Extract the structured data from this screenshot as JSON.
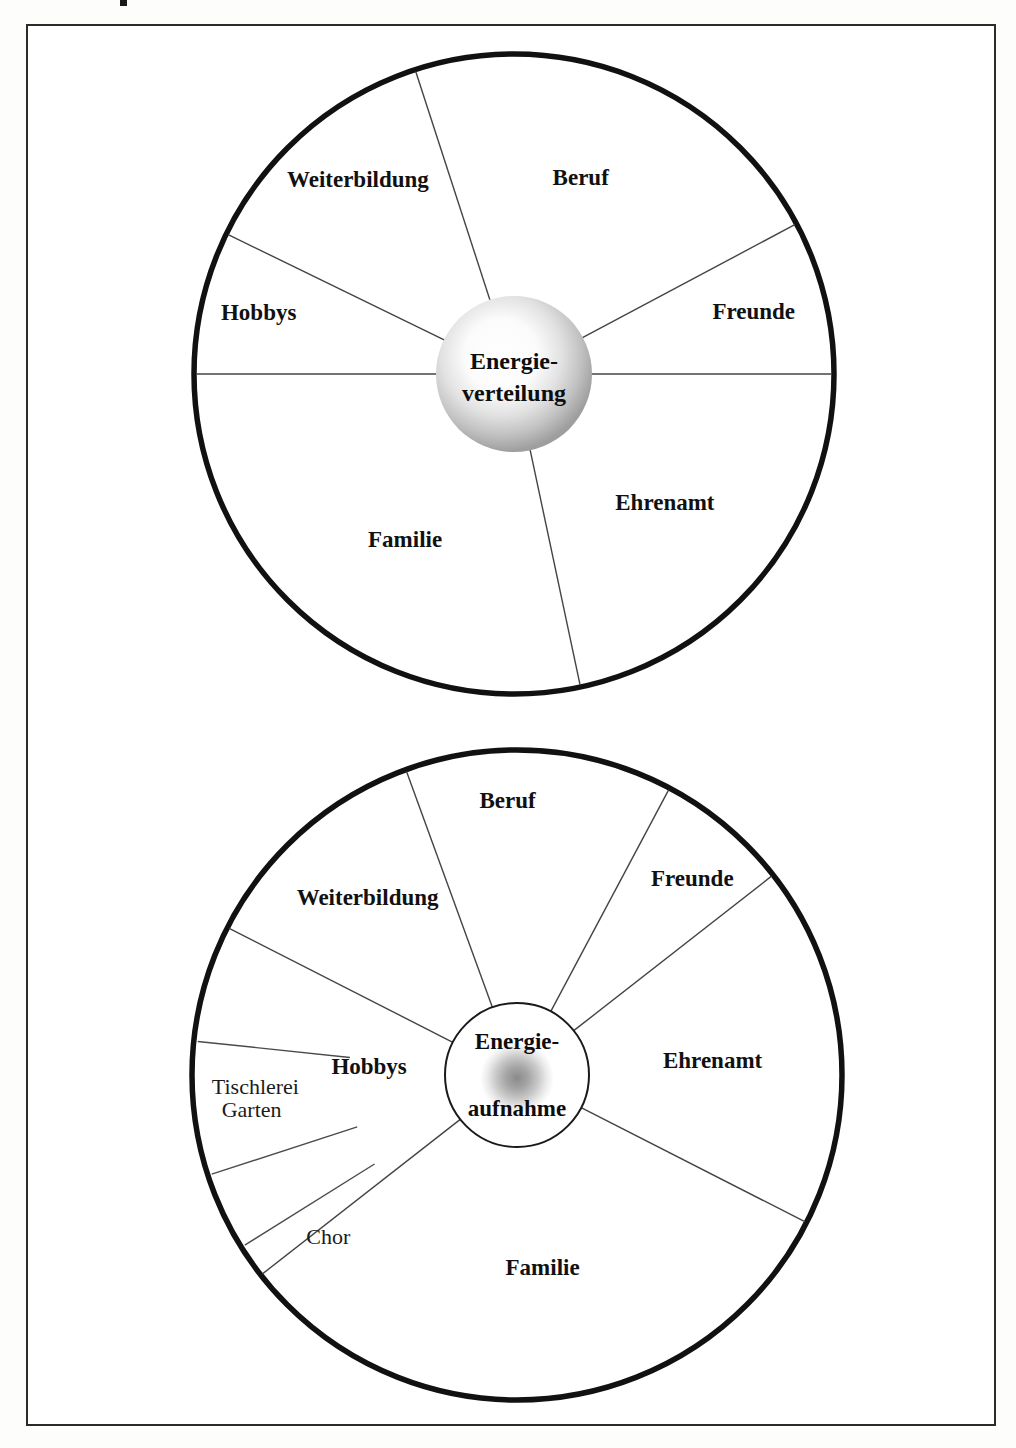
{
  "page": {
    "background_color": "#ffffff",
    "frame_color": "#2b2b2b"
  },
  "diagrams": [
    {
      "id": "energieverteilung",
      "hub_line1": "Energie-",
      "hub_line2": "verteilung",
      "hub_style": "light-sphere",
      "sectors": [
        {
          "label": "Beruf",
          "start_deg": 342,
          "end_deg": 62
        },
        {
          "label": "Freunde",
          "start_deg": 62,
          "end_deg": 90
        },
        {
          "label": "Ehrenamt",
          "start_deg": 90,
          "end_deg": 168
        },
        {
          "label": "Familie",
          "start_deg": 168,
          "end_deg": 270
        },
        {
          "label": "Hobbys",
          "start_deg": 270,
          "end_deg": 296
        },
        {
          "label": "Weiterbildung",
          "start_deg": 296,
          "end_deg": 342
        }
      ]
    },
    {
      "id": "energieaufnahme",
      "hub_line1": "Energie-",
      "hub_line2": "aufnahme",
      "hub_style": "dark-blob",
      "sectors": [
        {
          "label": "Beruf",
          "start_deg": 340,
          "end_deg": 28
        },
        {
          "label": "Freunde",
          "start_deg": 28,
          "end_deg": 52
        },
        {
          "label": "Ehrenamt",
          "start_deg": 52,
          "end_deg": 117
        },
        {
          "label": "Familie",
          "start_deg": 117,
          "end_deg": 232
        },
        {
          "label": "Hobbys",
          "start_deg": 232,
          "end_deg": 297
        },
        {
          "label": "Weiterbildung",
          "start_deg": 297,
          "end_deg": 340
        }
      ],
      "sub_sectors": [
        {
          "label": "Garten",
          "parent": "Hobbys",
          "angle_deg": 252
        },
        {
          "label": "Tischlerei",
          "parent": "Hobbys",
          "angle_deg": 276
        },
        {
          "label": "Chor",
          "parent": "Hobbys",
          "angle_deg": 238
        }
      ]
    }
  ],
  "colors": {
    "ink": "#111111",
    "hairline": "#444444",
    "rim": "#111111",
    "paper": "#ffffff"
  }
}
